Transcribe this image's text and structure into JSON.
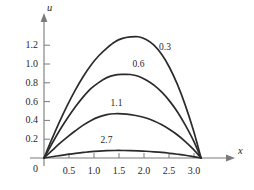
{
  "chart_data": {
    "type": "line",
    "title": "",
    "subtitle": "",
    "xlabel": "x",
    "ylabel": "u",
    "xlim": [
      -0.18,
      3.55
    ],
    "ylim": [
      -0.06,
      1.42
    ],
    "grid": false,
    "legend_position": "inline-curve-labels",
    "annotations_note": "each curve is labelled inline with its time value t",
    "x_ticks": [
      "0",
      "0.5",
      "1.0",
      "1.5",
      "2.0",
      "2.5",
      "3.0"
    ],
    "x_tick_values": [
      0,
      0.5,
      1.0,
      1.5,
      2.0,
      2.5,
      3.0
    ],
    "y_ticks": [
      "0",
      "0.2",
      "0.4",
      "0.6",
      "0.8",
      "1.0",
      "1.2"
    ],
    "y_tick_values": [
      0,
      0.2,
      0.4,
      0.6,
      0.8,
      1.0,
      1.2
    ],
    "domain_endpoints": [
      0,
      3.14159
    ],
    "series": [
      {
        "name": "0.3",
        "label": "0.3",
        "peak_x": 1.84,
        "peak_y": 1.29,
        "x": [
          0,
          0.157,
          0.314,
          0.471,
          0.628,
          0.785,
          0.942,
          1.1,
          1.257,
          1.414,
          1.571,
          1.728,
          1.885,
          2.042,
          2.199,
          2.356,
          2.513,
          2.67,
          2.827,
          2.985,
          3.142
        ],
        "y": [
          0,
          0.2,
          0.39,
          0.565,
          0.725,
          0.867,
          0.99,
          1.09,
          1.17,
          1.235,
          1.272,
          1.288,
          1.29,
          1.26,
          1.2,
          1.1,
          0.96,
          0.78,
          0.56,
          0.3,
          0
        ]
      },
      {
        "name": "0.6",
        "label": "0.6",
        "peak_x": 1.72,
        "peak_y": 0.89,
        "x": [
          0,
          0.157,
          0.314,
          0.471,
          0.628,
          0.785,
          0.942,
          1.1,
          1.257,
          1.414,
          1.571,
          1.728,
          1.885,
          2.042,
          2.199,
          2.356,
          2.513,
          2.67,
          2.827,
          2.985,
          3.142
        ],
        "y": [
          0,
          0.15,
          0.295,
          0.425,
          0.545,
          0.65,
          0.74,
          0.805,
          0.855,
          0.882,
          0.889,
          0.888,
          0.87,
          0.83,
          0.775,
          0.7,
          0.605,
          0.49,
          0.35,
          0.19,
          0
        ]
      },
      {
        "name": "1.1",
        "label": "1.1",
        "peak_x": 1.62,
        "peak_y": 0.47,
        "x": [
          0,
          0.157,
          0.314,
          0.471,
          0.628,
          0.785,
          0.942,
          1.1,
          1.257,
          1.414,
          1.571,
          1.728,
          1.885,
          2.042,
          2.199,
          2.356,
          2.513,
          2.67,
          2.827,
          2.985,
          3.142
        ],
        "y": [
          0,
          0.078,
          0.155,
          0.225,
          0.29,
          0.35,
          0.4,
          0.438,
          0.462,
          0.471,
          0.47,
          0.462,
          0.447,
          0.425,
          0.393,
          0.353,
          0.303,
          0.245,
          0.175,
          0.094,
          0
        ]
      },
      {
        "name": "2.7",
        "label": "2.7",
        "peak_x": 1.57,
        "peak_y": 0.08,
        "x": [
          0,
          0.157,
          0.314,
          0.471,
          0.628,
          0.785,
          0.942,
          1.1,
          1.257,
          1.414,
          1.571,
          1.728,
          1.885,
          2.042,
          2.199,
          2.356,
          2.513,
          2.67,
          2.827,
          2.985,
          3.142
        ],
        "y": [
          0,
          0.013,
          0.026,
          0.038,
          0.049,
          0.059,
          0.068,
          0.074,
          0.078,
          0.08,
          0.08,
          0.079,
          0.076,
          0.072,
          0.066,
          0.059,
          0.05,
          0.04,
          0.029,
          0.015,
          0
        ]
      }
    ],
    "curve_label_positions": [
      {
        "label": "0.3",
        "x": 2.48,
        "y": 1.17
      },
      {
        "label": "0.6",
        "x": 1.95,
        "y": 0.99
      },
      {
        "label": "1.1",
        "x": 1.51,
        "y": 0.575
      },
      {
        "label": "2.7",
        "x": 1.31,
        "y": 0.185
      }
    ],
    "colors": {
      "curve": "#2b2b2b",
      "axis": "#7a7a7a",
      "text": "#1f1f1f",
      "background": "#ffffff"
    }
  }
}
